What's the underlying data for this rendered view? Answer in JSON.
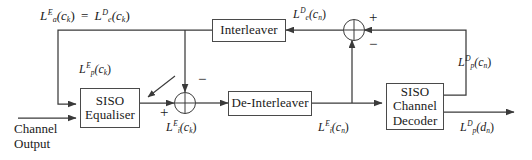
{
  "diagram": {
    "stroke_color": "#3a3a3a",
    "text_color": "#1a1a1a",
    "background": "#ffffff"
  },
  "blocks": {
    "equaliser": {
      "line1": "SISO",
      "line2": "Equaliser"
    },
    "deinterleaver": {
      "line1": "De-Interleaver"
    },
    "interleaver": {
      "line1": "Interleaver"
    },
    "decoder": {
      "line1": "SISO",
      "line2": "Channel",
      "line3": "Decoder"
    }
  },
  "labels": {
    "feedback_top": {
      "text": "La^E(ck) = Le^D(ck)",
      "L1": "L",
      "sub1": "a",
      "sup1": "E",
      "arg1": "(c",
      "argsub1": "k",
      "argend1": ")",
      "eq": "=",
      "L2": "L",
      "sub2": "e",
      "sup2": "D",
      "arg2": "(c",
      "argsub2": "k",
      "argend2": ")"
    },
    "lp_e_ck": {
      "L": "L",
      "sub": "p",
      "sup": "E",
      "arg": "(c",
      "argsub": "k",
      "argend": ")"
    },
    "li_e_ck": {
      "L": "L",
      "sub": "i",
      "sup": "E",
      "arg": "(c",
      "argsub": "k",
      "argend": ")"
    },
    "li_e_cn": {
      "L": "L",
      "sub": "i",
      "sup": "E",
      "arg": "(c",
      "argsub": "n",
      "argend": ")"
    },
    "le_d_cn": {
      "L": "L",
      "sub": "e",
      "sup": "D",
      "arg": "(c",
      "argsub": "n",
      "argend": ")"
    },
    "lp_d_cn": {
      "L": "L",
      "sub": "p",
      "sup": "D",
      "arg": "(c",
      "argsub": "n",
      "argend": ")"
    },
    "lp_d_dn": {
      "L": "L",
      "sub": "p",
      "sup": "D",
      "arg": "(d",
      "argsub": "n",
      "argend": ")"
    },
    "channel_input": {
      "line1": "Channel",
      "line2": "Output"
    }
  },
  "signs": {
    "adder_left_minus": "−",
    "adder_left_plus": "+",
    "adder_right_plus": "+",
    "adder_right_minus": "−"
  }
}
